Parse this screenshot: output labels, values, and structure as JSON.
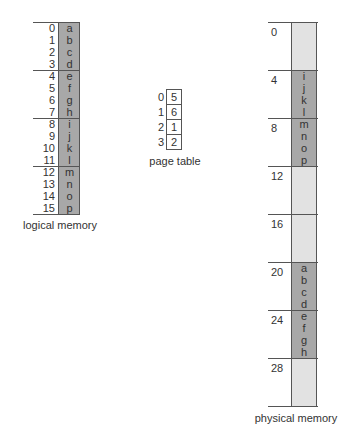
{
  "logical_memory": {
    "label": "logical memory",
    "entries": [
      {
        "addr": "0",
        "val": "a"
      },
      {
        "addr": "1",
        "val": "b"
      },
      {
        "addr": "2",
        "val": "c"
      },
      {
        "addr": "3",
        "val": "d"
      },
      {
        "addr": "4",
        "val": "e"
      },
      {
        "addr": "5",
        "val": "f"
      },
      {
        "addr": "6",
        "val": "g"
      },
      {
        "addr": "7",
        "val": "h"
      },
      {
        "addr": "8",
        "val": "i"
      },
      {
        "addr": "9",
        "val": "j"
      },
      {
        "addr": "10",
        "val": "k"
      },
      {
        "addr": "11",
        "val": "l"
      },
      {
        "addr": "12",
        "val": "m"
      },
      {
        "addr": "13",
        "val": "n"
      },
      {
        "addr": "14",
        "val": "o"
      },
      {
        "addr": "15",
        "val": "p"
      }
    ]
  },
  "page_table": {
    "label": "page table",
    "entries": [
      {
        "page": "0",
        "frame": "5"
      },
      {
        "page": "1",
        "frame": "6"
      },
      {
        "page": "2",
        "frame": "1"
      },
      {
        "page": "3",
        "frame": "2"
      }
    ]
  },
  "physical_memory": {
    "label": "physical memory",
    "frames": [
      {
        "addr": "0",
        "contents": []
      },
      {
        "addr": "4",
        "contents": [
          "i",
          "j",
          "k",
          "l"
        ]
      },
      {
        "addr": "8",
        "contents": [
          "m",
          "n",
          "o",
          "p"
        ]
      },
      {
        "addr": "12",
        "contents": []
      },
      {
        "addr": "16",
        "contents": []
      },
      {
        "addr": "20",
        "contents": [
          "a",
          "b",
          "c",
          "d"
        ]
      },
      {
        "addr": "24",
        "contents": [
          "e",
          "f",
          "g",
          "h"
        ]
      },
      {
        "addr": "28",
        "contents": []
      }
    ]
  },
  "colors": {
    "used_cell": "#a8a8a8",
    "empty_cell": "#e2e2e2",
    "line": "#555555"
  }
}
